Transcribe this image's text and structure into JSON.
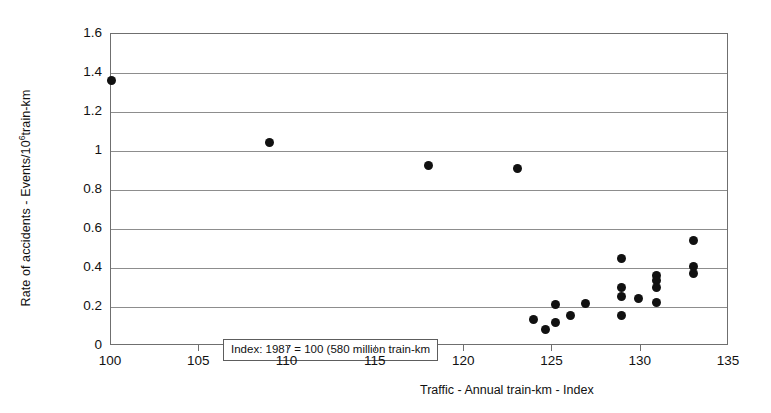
{
  "chart_data": {
    "type": "scatter",
    "title": "",
    "xlabel": "Traffic - Annual train-km - Index",
    "ylabel": "Rate of accidents - Events/10⁶train-km",
    "ylabel_main": "Rate of accidents - Events/10",
    "ylabel_sup": "6",
    "ylabel_tail": "train-km",
    "xlim": [
      100,
      135
    ],
    "ylim": [
      0,
      1.6
    ],
    "xticks": [
      100,
      105,
      110,
      115,
      120,
      125,
      130,
      135
    ],
    "yticks": [
      0,
      0.2,
      0.4,
      0.6,
      0.8,
      1,
      1.2,
      1.4,
      1.6
    ],
    "ytick_labels": [
      "0",
      "0.2",
      "0.4",
      "0.6",
      "0.8",
      "1",
      "1.2",
      "1.4",
      "1.6"
    ],
    "xtick_labels": [
      "100",
      "105",
      "110",
      "115",
      "120",
      "125",
      "130",
      "135"
    ],
    "grid": true,
    "grid_axis": "y",
    "legend": "none",
    "marker_color": "#111111",
    "points": [
      {
        "x": 100.0,
        "y": 1.36
      },
      {
        "x": 109.0,
        "y": 1.045
      },
      {
        "x": 118.0,
        "y": 0.925
      },
      {
        "x": 123.0,
        "y": 0.91
      },
      {
        "x": 123.9,
        "y": 0.135
      },
      {
        "x": 124.6,
        "y": 0.085
      },
      {
        "x": 125.2,
        "y": 0.12
      },
      {
        "x": 125.2,
        "y": 0.215
      },
      {
        "x": 126.0,
        "y": 0.155
      },
      {
        "x": 126.9,
        "y": 0.22
      },
      {
        "x": 128.9,
        "y": 0.45
      },
      {
        "x": 128.9,
        "y": 0.3
      },
      {
        "x": 128.9,
        "y": 0.255
      },
      {
        "x": 128.9,
        "y": 0.155
      },
      {
        "x": 129.9,
        "y": 0.245
      },
      {
        "x": 130.9,
        "y": 0.36
      },
      {
        "x": 130.9,
        "y": 0.335
      },
      {
        "x": 130.9,
        "y": 0.3
      },
      {
        "x": 130.9,
        "y": 0.225
      },
      {
        "x": 133.0,
        "y": 0.54
      },
      {
        "x": 133.0,
        "y": 0.41
      },
      {
        "x": 133.0,
        "y": 0.37
      }
    ]
  },
  "annotation": {
    "text": "Index: 1987 = 100 (580 million train-km"
  }
}
